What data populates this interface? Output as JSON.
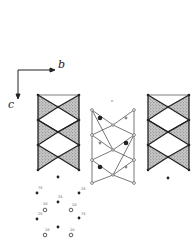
{
  "figure": {
    "type": "crystal structure projection",
    "axes": {
      "horizontal": {
        "label": "b",
        "direction": "right"
      },
      "vertical": {
        "label": "c",
        "direction": "down"
      }
    },
    "colors": {
      "ink": "#222222",
      "shade": "#9a9a9a",
      "open_line": "#444444",
      "background": "#ffffff"
    },
    "center_chain": {
      "top_label": "n"
    },
    "atom_cluster": {
      "labels": [
        {
          "id": "a1",
          "text": "75"
        },
        {
          "id": "a2",
          "text": "25"
        },
        {
          "id": "a3",
          "text": "25"
        },
        {
          "id": "a4",
          "text": "10"
        },
        {
          "id": "a5",
          "text": "10"
        },
        {
          "id": "a6",
          "text": "25"
        },
        {
          "id": "a7",
          "text": "75"
        },
        {
          "id": "a8",
          "text": "10"
        },
        {
          "id": "a9",
          "text": "10"
        }
      ]
    }
  }
}
